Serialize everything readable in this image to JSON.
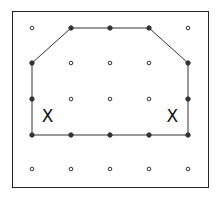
{
  "diagram": {
    "type": "geoboard",
    "grid": {
      "columns": [
        32,
        71,
        110,
        149,
        188
      ],
      "rows": [
        28,
        63,
        99,
        135,
        169
      ]
    },
    "frame": {
      "x": 12,
      "y": 11,
      "width": 196,
      "height": 176
    },
    "polygon": {
      "vertices": [
        [
          0,
          1
        ],
        [
          1,
          0
        ],
        [
          2,
          0
        ],
        [
          3,
          0
        ],
        [
          4,
          1
        ],
        [
          4,
          2
        ],
        [
          4,
          3
        ],
        [
          3,
          3
        ],
        [
          2,
          3
        ],
        [
          1,
          3
        ],
        [
          0,
          3
        ],
        [
          0,
          2
        ]
      ],
      "stroke": "#333333"
    },
    "filled_pegs": [
      [
        0,
        1
      ],
      [
        1,
        0
      ],
      [
        2,
        0
      ],
      [
        3,
        0
      ],
      [
        4,
        1
      ],
      [
        4,
        2
      ],
      [
        4,
        3
      ],
      [
        3,
        3
      ],
      [
        2,
        3
      ],
      [
        1,
        3
      ],
      [
        0,
        3
      ],
      [
        0,
        2
      ]
    ],
    "marks": [
      {
        "symbol": "X",
        "col": 0.4,
        "row": 2.5
      },
      {
        "symbol": "X",
        "col": 3.6,
        "row": 2.5
      }
    ]
  }
}
